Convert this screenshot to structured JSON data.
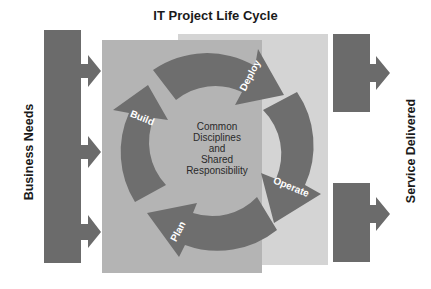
{
  "title": "IT Project Life Cycle",
  "left_label": "Business Needs",
  "right_label": "Service Delivered",
  "center": {
    "lines": [
      "Common",
      "Disciplines",
      "and",
      "Shared",
      "Responsibility"
    ]
  },
  "cycle_stages": [
    {
      "label": "Build"
    },
    {
      "label": "Deploy"
    },
    {
      "label": "Operate"
    },
    {
      "label": "Plan"
    }
  ],
  "colors": {
    "bar": "#6b6b6b",
    "panel_dark": "#b3b3b3",
    "panel_light": "#d3d3d3",
    "arrow": "#6e6e6e",
    "arrow_text": "#ffffff"
  }
}
